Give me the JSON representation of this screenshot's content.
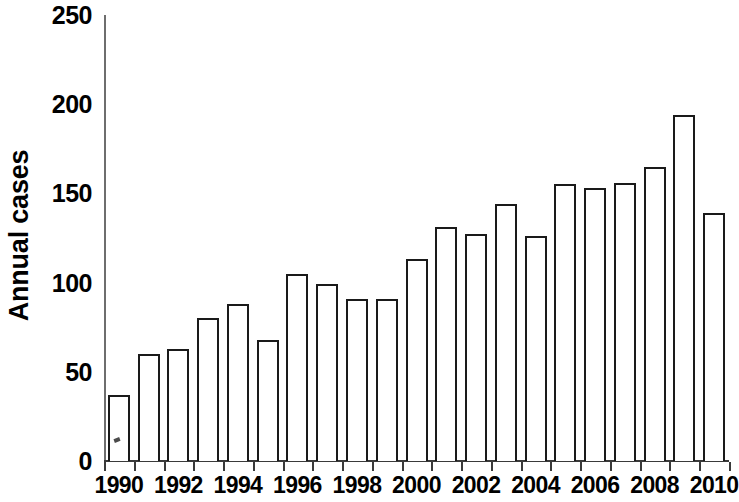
{
  "chart_data": {
    "type": "bar",
    "title": "",
    "xlabel": "",
    "ylabel": "Annual cases",
    "ylim": [
      0,
      250
    ],
    "ytick_values": [
      250,
      200,
      150,
      100,
      50,
      0
    ],
    "ytick_labels": [
      "250",
      "200",
      "150",
      "100",
      "50",
      "0"
    ],
    "xlim": [
      1990,
      2010
    ],
    "xtick_labels": [
      "1990",
      "1992",
      "1994",
      "1996",
      "1998",
      "2000",
      "2002",
      "2004",
      "2006",
      "2008",
      "2010"
    ],
    "grid": false,
    "legend": false,
    "legend_position": "none",
    "bar_style": {
      "fill": "#ffffff",
      "edge": "#1a1a1a",
      "edge_width_px": 2
    },
    "categories": [
      "1990",
      "1991",
      "1992",
      "1993",
      "1994",
      "1995",
      "1996",
      "1997",
      "1998",
      "1999",
      "2000",
      "2001",
      "2002",
      "2003",
      "2004",
      "2005",
      "2006",
      "2007",
      "2008",
      "2009",
      "2010"
    ],
    "values": [
      37,
      60,
      63,
      80,
      88,
      68,
      105,
      99,
      91,
      91,
      113,
      131,
      127,
      144,
      126,
      155,
      153,
      156,
      165,
      194,
      139
    ],
    "annotations": [
      {
        "name": "scan-speck",
        "description": "small dark scanning artifact inside the 1990 bar",
        "category": "1990",
        "value": 13
      }
    ]
  }
}
